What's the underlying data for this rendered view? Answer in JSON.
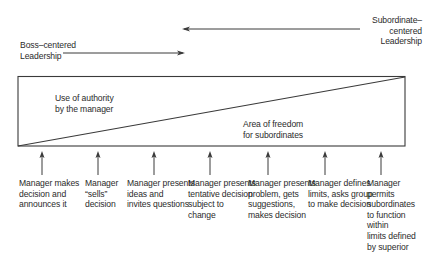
{
  "diagram": {
    "title_arrows": {
      "boss_centered": "Boss–centered\nLeadership",
      "subordinate_centered": "Subordinate–centered\nLeadership"
    },
    "regions": {
      "manager_authority": "Use of authority\nby the manager",
      "subordinate_freedom": "Area of freedom\nfor subordinates"
    },
    "behaviors": [
      {
        "label": "Manager makes\ndecision and\nannounces it"
      },
      {
        "label": "Manager\n“sells”\ndecision"
      },
      {
        "label": "Manager presents\nideas and\ninvites questions"
      },
      {
        "label": "Manager presents\ntentative decision\nsubject to\nchange"
      },
      {
        "label": "Manager presents\nproblem, gets\nsuggestions,\nmakes decision"
      },
      {
        "label": "Manager defines\nlimits, asks group\nto make decision"
      },
      {
        "label": "Manager\npermits\nsubordinates\nto function\nwithin\nlimits defined\nby superior"
      }
    ],
    "colors": {
      "line": "#3a3a3a",
      "text": "#2b2b2b",
      "background": "#ffffff"
    }
  }
}
